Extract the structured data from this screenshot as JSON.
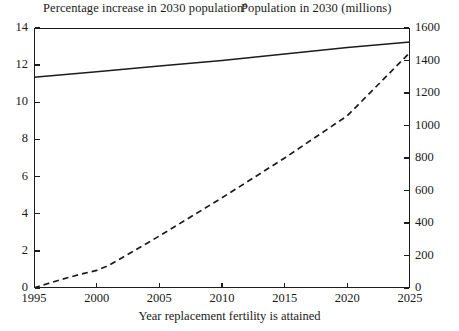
{
  "header": {
    "left_title": "Percentage increase in 2030 population",
    "left_title_superscript": "a",
    "right_title": "Population in 2030 (millions)"
  },
  "axis": {
    "x_title": "Year replacement fertility is attained"
  },
  "chart_data": {
    "type": "line",
    "title": "",
    "subtitle": "",
    "xlabel": "Year replacement fertility is attained",
    "ylabel": "Percentage increase in 2030 population",
    "y2label": "Population in 2030 (millions)",
    "xlim": [
      1995,
      2025
    ],
    "ylim": [
      0,
      14
    ],
    "y2lim": [
      0,
      1600
    ],
    "xticks": [
      1995,
      2000,
      2005,
      2010,
      2015,
      2020,
      2025
    ],
    "yticks": [
      0,
      2,
      4,
      6,
      8,
      10,
      12,
      14
    ],
    "y2ticks": [
      0,
      200,
      400,
      600,
      800,
      1000,
      1200,
      1400,
      1600
    ],
    "xtick_labels": [
      "1995",
      "2000",
      "2005",
      "2010",
      "2015",
      "2020",
      "2025"
    ],
    "ytick_labels": [
      "0",
      "2",
      "4",
      "6",
      "8",
      "10",
      "12",
      "14"
    ],
    "y2tick_labels": [
      "0",
      "200",
      "400",
      "600",
      "800",
      "1000",
      "1200",
      "1400",
      "1600"
    ],
    "grid": false,
    "legend": "none",
    "series": [
      {
        "name": "Percentage increase in 2030 population",
        "axis": "left",
        "style": "solid",
        "color": "#1c1c1c",
        "x": [
          1995,
          2000,
          2005,
          2010,
          2015,
          2020,
          2025
        ],
        "values": [
          11.35,
          11.65,
          11.95,
          12.25,
          12.6,
          12.95,
          13.25
        ]
      },
      {
        "name": "Population in 2030 (millions)",
        "axis": "right",
        "style": "dashed",
        "color": "#1c1c1c",
        "x": [
          1995,
          1996,
          1997,
          1998,
          1999,
          2000,
          2001,
          2002,
          2005,
          2010,
          2015,
          2020,
          2025
        ],
        "values": [
          0,
          25,
          48,
          70,
          90,
          108,
          140,
          185,
          320,
          555,
          800,
          1060,
          1450
        ]
      }
    ]
  }
}
